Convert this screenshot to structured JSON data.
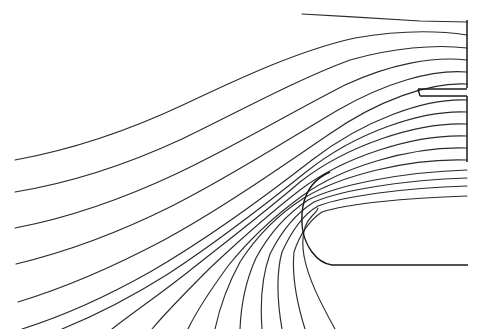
{
  "figure": {
    "kind": "streamline-plot",
    "title": "",
    "background_color": "#ffffff",
    "line_color": "#2b2b2b",
    "wall_color": "#1a1a1a",
    "width": 495,
    "height": 329
  },
  "chart_data": {
    "type": "line",
    "title": "",
    "subtitle": "",
    "xlabel": "",
    "ylabel": "",
    "grid": false,
    "legend": null,
    "axis_visible": false,
    "tick_labels": [],
    "annotations": [],
    "xlim": [
      0,
      495
    ],
    "ylim": [
      329,
      0
    ],
    "series": [
      {
        "name": "streamline-01",
        "role": "duct-upper-wall-streamline",
        "exit_y": 22,
        "points": "M 302 14 C 340 16 390 19 420 21 L 467 22"
      },
      {
        "name": "streamline-02",
        "exit_y": 35,
        "points": "M 15 160 C 70 150 130 130 185 104 C 240 78 300 50 355 38 C 395 31 435 30 467 35"
      },
      {
        "name": "streamline-03",
        "exit_y": 48,
        "points": "M 15 192 C 70 183 128 164 182 139 C 238 112 296 80 350 60 C 392 48 435 44 467 48"
      },
      {
        "name": "streamline-04",
        "exit_y": 60,
        "points": "M 15 228 C 68 218 125 198 178 173 C 233 147 292 112 345 85 C 390 64 434 56 467 60"
      },
      {
        "name": "streamline-05",
        "exit_y": 72,
        "points": "M 16 264 C 66 252 120 232 172 206 C 226 179 284 142 338 110 C 385 83 432 69 467 72"
      },
      {
        "name": "streamline-06",
        "exit_y": 84,
        "points": "M 18 302 C 64 288 115 266 164 240 C 216 212 274 172 328 135 C 378 100 430 82 467 84"
      },
      {
        "name": "streamline-07",
        "exit_y": 100,
        "points": "M 22 329 C 60 317 104 298 150 272 C 202 242 258 202 312 160 C 364 120 425 98 467 100"
      },
      {
        "name": "streamline-08",
        "exit_y": 112,
        "points": "M 62 329 C 94 316 130 298 168 274 C 214 244 266 204 306 172 C 356 132 422 110 467 112"
      },
      {
        "name": "streamline-09",
        "exit_y": 124,
        "points": "M 112 329 C 134 312 160 294 188 272 C 226 242 270 208 300 182 C 346 146 416 122 467 124"
      },
      {
        "name": "streamline-10",
        "exit_y": 136,
        "points": "M 152 329 C 168 310 188 290 210 268 C 242 238 274 210 300 190 C 342 158 412 134 467 136"
      },
      {
        "name": "streamline-11",
        "exit_y": 148,
        "points": "M 188 329 C 198 308 212 288 228 266 C 252 236 280 212 302 196 C 340 168 410 146 467 148"
      },
      {
        "name": "streamline-12",
        "exit_y": 160,
        "points": "M 215 329 C 220 306 228 284 240 262 C 258 234 282 212 304 198 C 340 176 408 158 467 160"
      },
      {
        "name": "streamline-13",
        "role": "near-lip",
        "exit_y": 170,
        "points": "M 240 329 C 241 304 246 280 256 258 C 270 232 290 212 308 200 C 340 184 405 172 467 170"
      },
      {
        "name": "streamline-14",
        "role": "near-lip",
        "exit_y": 178,
        "points": "M 262 329 C 260 302 262 276 270 254 C 282 230 298 212 314 202 C 342 190 404 180 467 178"
      },
      {
        "name": "streamline-15",
        "role": "lip-inner",
        "exit_y": 186,
        "points": "M 282 329 C 277 300 276 274 282 252 C 292 230 304 214 318 206 C 344 196 404 188 467 186"
      },
      {
        "name": "streamline-16",
        "role": "lip-inner",
        "exit_y": 196,
        "points": "M 305 329 C 296 300 292 272 294 252 C 300 234 310 220 322 212 C 346 204 404 198 467 196"
      },
      {
        "name": "streamline-17",
        "role": "stagnation-branch",
        "exit_y": 0,
        "points": "M 335 329 C 320 302 308 278 304 256 C 301 238 304 224 312 216 C 316 212 318 210 318 208"
      }
    ],
    "walls": [
      {
        "name": "duct-right-boundary-upper",
        "role": "outflow-plane-upper",
        "points": "M 467 20 L 467 88"
      },
      {
        "name": "duct-right-boundary-lower",
        "role": "outflow-plane-lower",
        "points": "M 467 96 L 467 162"
      },
      {
        "name": "splitter-plate-upper-surface",
        "points": "M 418 89 L 467 89"
      },
      {
        "name": "splitter-plate-lower-surface",
        "points": "M 420 96 L 467 96"
      },
      {
        "name": "splitter-plate-leading-edge",
        "points": "M 418 89 L 420 96"
      },
      {
        "name": "inlet-lip-body-wall",
        "role": "solid-body-contour",
        "points": "M 330 172 C 316 178 306 190 303 206 C 300 224 303 240 312 252 C 318 260 324 264 332 265 L 468 265"
      }
    ]
  }
}
